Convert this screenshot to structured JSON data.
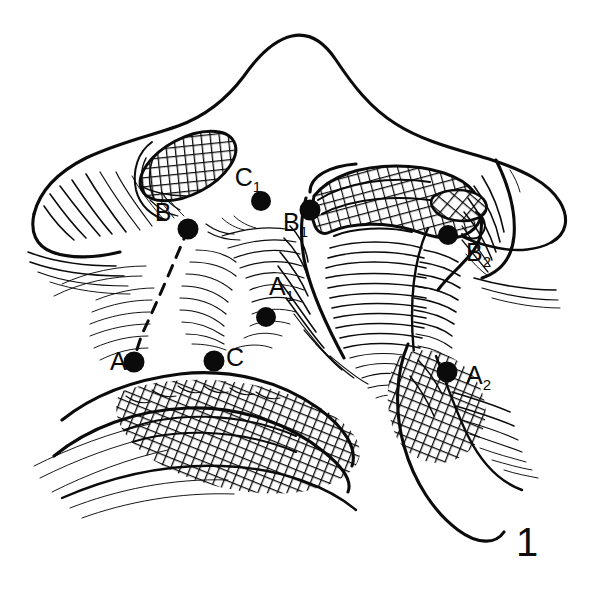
{
  "figure": {
    "number": "1",
    "number_position": {
      "x": 527,
      "y": 556
    },
    "background_color": "#ffffff",
    "ink_color": "#0b0b0b",
    "type": "line-drawing",
    "width": 600,
    "height": 607
  },
  "labels": [
    {
      "id": "label-B",
      "base": "B",
      "subscript": "",
      "x": 163,
      "y": 221,
      "anchor": "middle"
    },
    {
      "id": "label-C1",
      "base": "C",
      "subscript": "1",
      "x": 248,
      "y": 186,
      "anchor": "middle"
    },
    {
      "id": "label-B1",
      "base": "B",
      "subscript": "1",
      "x": 283,
      "y": 231,
      "anchor": "start"
    },
    {
      "id": "label-B2",
      "base": "B",
      "subscript": "2",
      "x": 466,
      "y": 261,
      "anchor": "start"
    },
    {
      "id": "label-A1",
      "base": "A",
      "subscript": "1",
      "x": 269,
      "y": 295,
      "anchor": "start"
    },
    {
      "id": "label-A",
      "base": "A",
      "subscript": "",
      "x": 110,
      "y": 370,
      "anchor": "start"
    },
    {
      "id": "label-C",
      "base": "C",
      "subscript": "",
      "x": 226,
      "y": 366,
      "anchor": "start"
    },
    {
      "id": "label-A2",
      "base": "A",
      "subscript": "2",
      "x": 466,
      "y": 384,
      "anchor": "start"
    }
  ],
  "landmark_points": [
    {
      "id": "point-B",
      "label": "B",
      "cx": 188,
      "cy": 229,
      "r": 10.5
    },
    {
      "id": "point-C1",
      "label": "C1",
      "cx": 261,
      "cy": 201,
      "r": 10.0
    },
    {
      "id": "point-B1",
      "label": "B1",
      "cx": 310,
      "cy": 210,
      "r": 10.5
    },
    {
      "id": "point-B2",
      "label": "B2",
      "cx": 448,
      "cy": 235,
      "r": 10.0
    },
    {
      "id": "point-A1",
      "label": "A1",
      "cx": 266,
      "cy": 317,
      "r": 10.0
    },
    {
      "id": "point-A",
      "label": "A",
      "cx": 134,
      "cy": 362,
      "r": 10.5
    },
    {
      "id": "point-C",
      "label": "C",
      "cx": 214,
      "cy": 361,
      "r": 10.5
    },
    {
      "id": "point-A2",
      "label": "A2",
      "cx": 447,
      "cy": 372,
      "r": 10.5
    }
  ],
  "measurement_line": {
    "id": "dashed-line-B-to-A",
    "style": "dashed",
    "from": "B",
    "to": "A",
    "path": "M 188 229 C 176 258, 158 300, 143 332 C 139 342, 136 352, 134 362"
  },
  "shaded_regions": [
    {
      "id": "left-crosshatch-oval",
      "pattern": "cross-hatch",
      "cx": 188,
      "cy": 166
    },
    {
      "id": "central-crosshatch-hood",
      "pattern": "cross-hatch"
    },
    {
      "id": "lower-left-crosshatch-band",
      "pattern": "cross-hatch"
    },
    {
      "id": "right-lower-crosshatch-band",
      "pattern": "cross-hatch"
    },
    {
      "id": "central-groove",
      "pattern": "horizontal-hatch"
    }
  ]
}
